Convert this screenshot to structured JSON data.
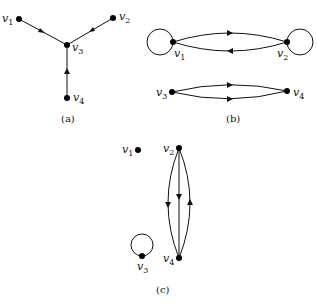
{
  "figure": {
    "panels": [
      {
        "caption": "(a)",
        "vertices": [
          {
            "name": "v",
            "sub": "1"
          },
          {
            "name": "v",
            "sub": "2"
          },
          {
            "name": "v",
            "sub": "3"
          },
          {
            "name": "v",
            "sub": "4"
          }
        ],
        "edges": [
          {
            "from": "v1",
            "to": "v3"
          },
          {
            "from": "v2",
            "to": "v3"
          },
          {
            "from": "v4",
            "to": "v3"
          }
        ]
      },
      {
        "caption": "(b)",
        "vertices": [
          {
            "name": "v",
            "sub": "1"
          },
          {
            "name": "v",
            "sub": "2"
          },
          {
            "name": "v",
            "sub": "3"
          },
          {
            "name": "v",
            "sub": "4"
          }
        ],
        "edges": [
          {
            "from": "v1",
            "to": "v1",
            "type": "loop"
          },
          {
            "from": "v1",
            "to": "v2"
          },
          {
            "from": "v2",
            "to": "v1"
          },
          {
            "from": "v2",
            "to": "v2",
            "type": "loop"
          },
          {
            "from": "v3",
            "to": "v4"
          },
          {
            "from": "v3",
            "to": "v4"
          }
        ]
      },
      {
        "caption": "(c)",
        "vertices": [
          {
            "name": "v",
            "sub": "1"
          },
          {
            "name": "v",
            "sub": "2"
          },
          {
            "name": "v",
            "sub": "3"
          },
          {
            "name": "v",
            "sub": "4"
          }
        ],
        "edges": [
          {
            "from": "v2",
            "to": "v4"
          },
          {
            "from": "v2",
            "to": "v4"
          },
          {
            "from": "v4",
            "to": "v2"
          },
          {
            "from": "v3",
            "to": "v3",
            "type": "loop"
          }
        ]
      }
    ]
  }
}
